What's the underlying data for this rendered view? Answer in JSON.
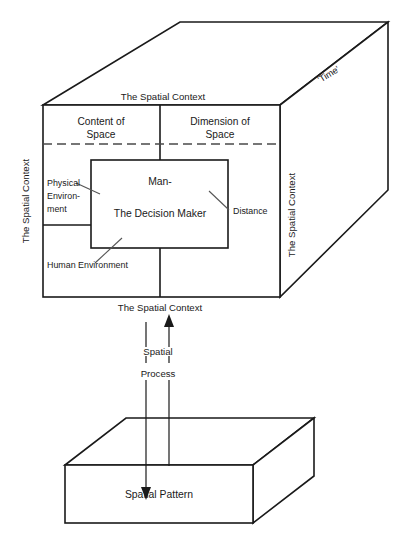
{
  "diagram": {
    "cube": {
      "top_context_label": "The Spatial Context",
      "bottom_context_label": "The Spatial Context",
      "left_context_label": "The Spatial Context",
      "right_context_label": "The Spatial Context",
      "depth_axis_label": "'Time'",
      "quadrants": {
        "top_left_line1": "Content of",
        "top_left_line2": "Space",
        "top_right_line1": "Dimension of",
        "top_right_line2": "Space"
      },
      "inner_box": {
        "line1": "Man-",
        "line2": "The Decision Maker"
      },
      "annotations": {
        "physical_environment_line1": "Physical",
        "physical_environment_line2": "Environ-",
        "physical_environment_line3": "ment",
        "human_environment": "Human Environment",
        "distance": "Distance"
      }
    },
    "connector": {
      "process_line1": "Spatial",
      "process_line2": "Process"
    },
    "slab": {
      "label": "Spatial Pattern"
    },
    "colors": {
      "ink": "#1a1a1a",
      "leader": "#555555",
      "dash": "#4a4a4a",
      "background": "#ffffff"
    }
  }
}
